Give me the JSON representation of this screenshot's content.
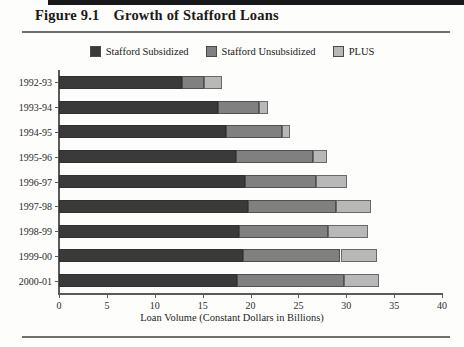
{
  "figure": {
    "number": "Figure 9.1",
    "title": "Growth of Stafford Loans"
  },
  "legend": {
    "position": "top-center",
    "items": [
      {
        "label": "Stafford Subsidized",
        "color": "#3a3a3a",
        "icon": "legend-swatch"
      },
      {
        "label": "Stafford Unsubsidized",
        "color": "#808080",
        "icon": "legend-swatch"
      },
      {
        "label": "PLUS",
        "color": "#b8b8b8",
        "icon": "legend-swatch"
      }
    ]
  },
  "chart_data": {
    "type": "bar",
    "orientation": "horizontal",
    "stacked": true,
    "title": "Growth of Stafford Loans",
    "xlabel": "Loan Volume (Constant Dollars in Billions)",
    "ylabel": "",
    "xlim": [
      0,
      40
    ],
    "xticks": [
      0,
      5,
      10,
      15,
      20,
      25,
      30,
      35,
      40
    ],
    "xticklabels": [
      "0",
      "5",
      "10",
      "15",
      "20",
      "25",
      "30",
      "35",
      "40"
    ],
    "grid": false,
    "categories": [
      "1992-93",
      "1993-94",
      "1994-95",
      "1995-96",
      "1996-97",
      "1997-98",
      "1998-99",
      "1999-00",
      "2000-01"
    ],
    "series": [
      {
        "name": "Stafford Subsidized",
        "color": "#3a3a3a",
        "values": [
          12.8,
          16.6,
          17.4,
          18.5,
          19.4,
          19.7,
          18.8,
          19.2,
          18.6
        ]
      },
      {
        "name": "Stafford Unsubsidized",
        "color": "#808080",
        "values": [
          2.3,
          4.3,
          5.9,
          8.0,
          7.4,
          9.2,
          9.3,
          10.2,
          11.2
        ]
      },
      {
        "name": "PLUS",
        "color": "#b8b8b8",
        "values": [
          1.9,
          0.9,
          0.8,
          1.5,
          3.3,
          3.7,
          4.2,
          3.8,
          3.6
        ]
      }
    ],
    "totals": [
      17.0,
      21.8,
      24.1,
      28.0,
      30.1,
      32.6,
      32.3,
      33.2,
      33.4
    ]
  },
  "xaxis_title": "Loan Volume (Constant Dollars in Billions)"
}
